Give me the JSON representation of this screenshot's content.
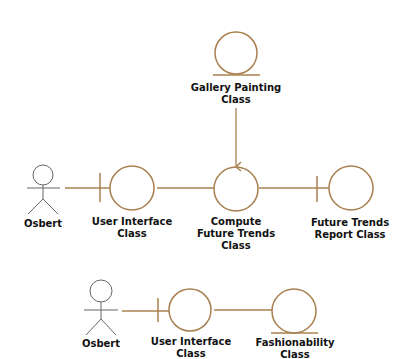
{
  "colors": {
    "connector": "#a8804f",
    "actor": "#666666",
    "text": "#111111",
    "background": "#ffffff"
  },
  "diagram_type": "UML collaboration / robustness diagram",
  "top_diagram": {
    "actor": {
      "label": "Osbert",
      "icon": "stick-figure-actor-icon"
    },
    "user_interface": {
      "line1": "User Interface",
      "line2": "Class",
      "icon": "boundary-class-icon"
    },
    "compute": {
      "line1": "Compute",
      "line2": "Future Trends",
      "line3": "Class",
      "icon": "control-class-icon"
    },
    "report": {
      "line1": "Future Trends",
      "line2": "Report Class",
      "icon": "boundary-class-icon"
    },
    "gallery": {
      "line1": "Gallery Painting",
      "line2": "Class",
      "icon": "entity-class-icon"
    }
  },
  "bottom_diagram": {
    "actor": {
      "label": "Osbert",
      "icon": "stick-figure-actor-icon"
    },
    "user_interface": {
      "line1": "User Interface",
      "line2": "Class",
      "icon": "boundary-class-icon"
    },
    "fashionability": {
      "line1": "Fashionability",
      "line2": "Class",
      "icon": "entity-class-icon"
    }
  }
}
